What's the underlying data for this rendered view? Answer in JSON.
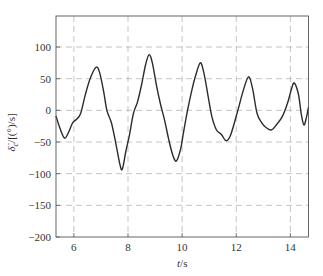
{
  "chart_data": {
    "type": "line",
    "title": "",
    "xlabel": "t/s",
    "xlabel_parts": {
      "var": "t",
      "unit": "/s"
    },
    "ylabel": "δ̇c/[(°)/s]",
    "ylabel_parts": {
      "var": "δ̇",
      "sub": "c",
      "unit": "/[(°)/s]"
    },
    "xlim": [
      5.34,
      14.67
    ],
    "ylim": [
      -200,
      149
    ],
    "xticks": [
      6,
      8,
      10,
      12,
      14
    ],
    "xtick_labels": [
      "6",
      "8",
      "10",
      "12",
      "14"
    ],
    "yticks": [
      -200,
      -150,
      -100,
      -50,
      0,
      50,
      100
    ],
    "ytick_labels": [
      "−200",
      "−150",
      "−100",
      "−50",
      "0",
      "50",
      "100"
    ],
    "grid": true,
    "grid_style": "dashed",
    "series": [
      {
        "name": "delta_c_rate",
        "color": "#2b2b2b",
        "x": [
          5.34,
          5.5,
          5.66,
          5.8,
          5.95,
          6.1,
          6.25,
          6.42,
          6.6,
          6.82,
          6.95,
          7.1,
          7.22,
          7.39,
          7.55,
          7.7,
          7.79,
          7.92,
          8.05,
          8.2,
          8.35,
          8.5,
          8.65,
          8.78,
          8.9,
          9.05,
          9.2,
          9.35,
          9.5,
          9.65,
          9.79,
          9.95,
          10.05,
          10.2,
          10.36,
          10.5,
          10.67,
          10.8,
          10.95,
          11.1,
          11.27,
          11.45,
          11.63,
          11.8,
          12.06,
          12.25,
          12.45,
          12.6,
          12.77,
          12.95,
          13.1,
          13.3,
          13.5,
          13.7,
          13.9,
          14.05,
          14.15,
          14.3,
          14.4,
          14.5,
          14.6,
          14.67
        ],
        "y": [
          -9,
          -30,
          -44,
          -35,
          -20,
          -14,
          -5,
          24,
          50,
          68,
          60,
          30,
          0,
          -20,
          -52,
          -85,
          -93,
          -65,
          -40,
          -5,
          13,
          40,
          72,
          88,
          75,
          40,
          10,
          -15,
          -45,
          -70,
          -80,
          -60,
          -35,
          0,
          32,
          55,
          75,
          60,
          25,
          -10,
          -31,
          -38,
          -48,
          -38,
          0,
          30,
          53,
          35,
          -5,
          -20,
          -27,
          -31,
          -22,
          -10,
          12,
          35,
          43,
          25,
          -5,
          -23,
          -10,
          5
        ]
      }
    ]
  }
}
